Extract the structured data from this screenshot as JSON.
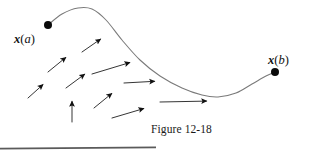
{
  "figure": {
    "caption": "Figure 12-18",
    "start_label": {
      "var": "x",
      "open": "(",
      "arg": "a",
      "close": ")"
    },
    "end_label": {
      "var": "x",
      "open": "(",
      "arg": "b",
      "close": ")"
    },
    "colors": {
      "curve": "#7a7a7a",
      "arrow": "#111111",
      "endpoint_dot": "#0a0a0a",
      "text": "#111111",
      "rule": "#5a5a5a",
      "background": "#ffffff"
    },
    "chart_data": {
      "type": "line",
      "title": "Figure 12-18",
      "xlabel": "",
      "ylabel": "",
      "xlim": [
        0,
        321
      ],
      "ylim": [
        165,
        0
      ],
      "grid": false,
      "legend": null,
      "annotations": [
        {
          "text": "x(a)",
          "x": 48,
          "y": 25,
          "role": "start-point-label"
        },
        {
          "text": "x(b)",
          "x": 275,
          "y": 72,
          "role": "end-point-label"
        },
        {
          "text": "Figure 12-18",
          "x": 162,
          "y": 129,
          "role": "caption"
        }
      ],
      "series": [
        {
          "name": "path-curve",
          "type": "line",
          "points": [
            [
              48,
              25
            ],
            [
              62,
              14
            ],
            [
              78,
              8
            ],
            [
              92,
              9
            ],
            [
              106,
              20
            ],
            [
              122,
              40
            ],
            [
              140,
              60
            ],
            [
              160,
              76
            ],
            [
              182,
              88
            ],
            [
              202,
              95
            ],
            [
              218,
              97
            ],
            [
              236,
              93
            ],
            [
              252,
              84
            ],
            [
              266,
              76
            ],
            [
              275,
              72
            ]
          ]
        }
      ],
      "markers": [
        {
          "name": "start-point",
          "x": 48,
          "y": 25,
          "r": 4
        },
        {
          "name": "end-point",
          "x": 275,
          "y": 72,
          "r": 4
        }
      ],
      "vector_field": [
        {
          "x1": 48,
          "y1": 72,
          "x2": 70,
          "y2": 54
        },
        {
          "x1": 82,
          "y1": 52,
          "x2": 105,
          "y2": 36
        },
        {
          "x1": 28,
          "y1": 98,
          "x2": 47,
          "y2": 81
        },
        {
          "x1": 66,
          "y1": 88,
          "x2": 89,
          "y2": 71
        },
        {
          "x1": 92,
          "y1": 74,
          "x2": 135,
          "y2": 61
        },
        {
          "x1": 72,
          "y1": 122,
          "x2": 72,
          "y2": 96
        },
        {
          "x1": 94,
          "y1": 108,
          "x2": 116,
          "y2": 90
        },
        {
          "x1": 124,
          "y1": 83,
          "x2": 160,
          "y2": 81
        },
        {
          "x1": 112,
          "y1": 118,
          "x2": 149,
          "y2": 107
        },
        {
          "x1": 160,
          "y1": 102,
          "x2": 212,
          "y2": 101
        }
      ]
    }
  }
}
